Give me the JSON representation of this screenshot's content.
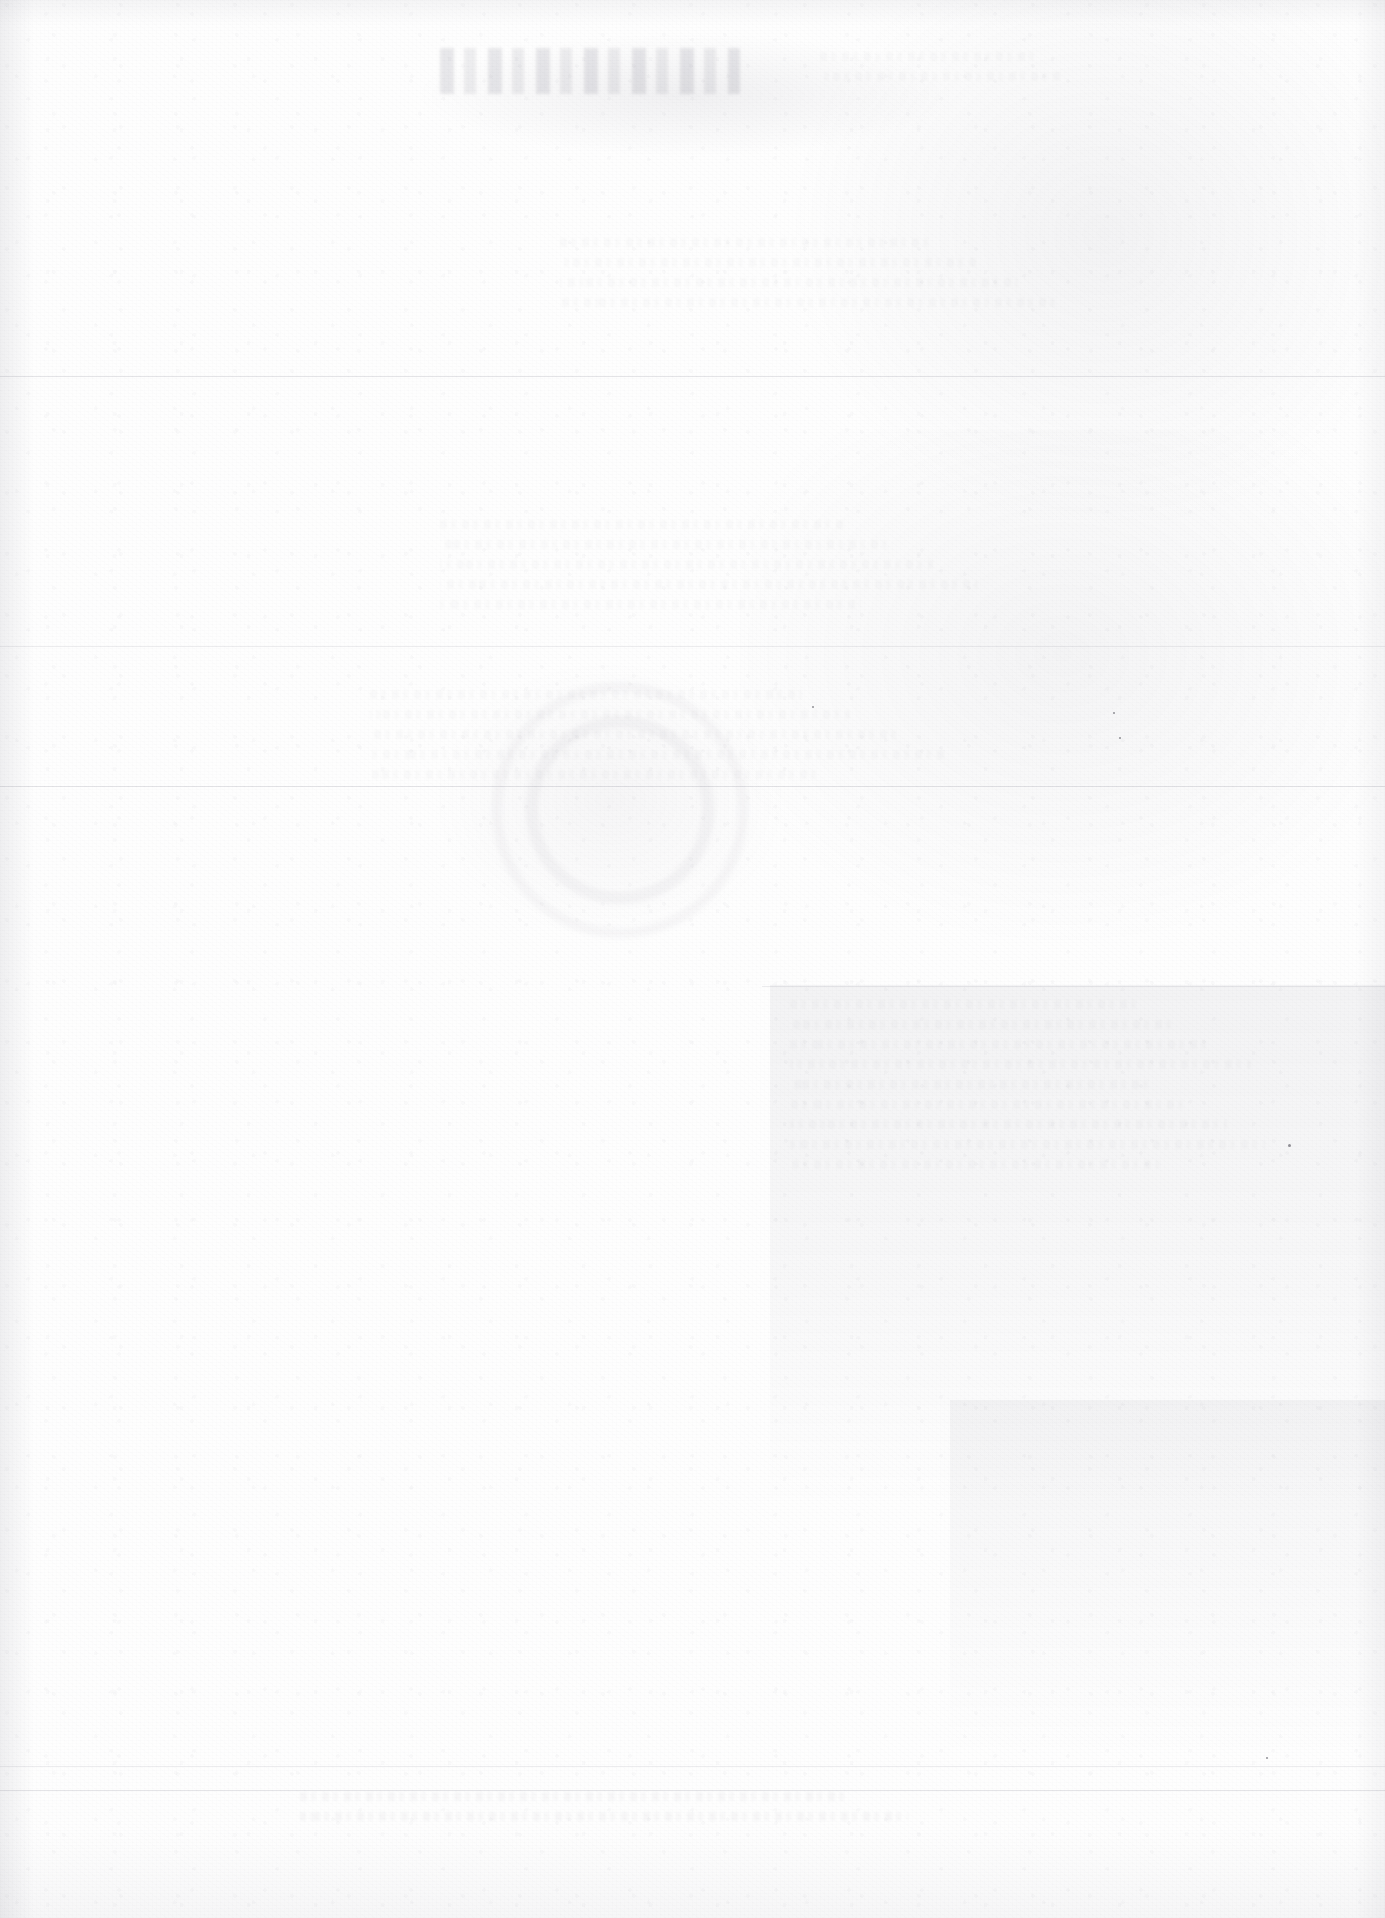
{
  "document": {
    "kind": "scanned-page",
    "condition": "heavily-bleached",
    "legible_text": "",
    "page_width": 1385,
    "page_height": 1918,
    "background_color": "#fefefe",
    "ink_color": "#78768a",
    "note": "No legible characters survive on this scan; only faint ghost impressions, horizontal rules and paper grain are visible."
  },
  "regions": {
    "title_band_label": "",
    "upper_body_label": "",
    "mid_body_label": "",
    "lower_body_label": "",
    "footer_band_label": ""
  },
  "rules": [
    {
      "name": "rule-upper",
      "x": 0,
      "y": 376,
      "width": 1385,
      "weight": "soft"
    },
    {
      "name": "rule-mid-upper",
      "x": 0,
      "y": 646,
      "width": 1385,
      "weight": "softer"
    },
    {
      "name": "rule-mid",
      "x": 0,
      "y": 786,
      "width": 1385,
      "weight": "soft"
    },
    {
      "name": "rule-band-top",
      "x": 762,
      "y": 986,
      "width": 623,
      "weight": "softer"
    },
    {
      "name": "rule-footer-upper",
      "x": 0,
      "y": 1766,
      "width": 1385,
      "weight": "softer"
    },
    {
      "name": "rule-footer",
      "x": 0,
      "y": 1790,
      "width": 1385,
      "weight": "soft"
    }
  ],
  "ghost_text_blocks": [
    {
      "name": "ghost-title",
      "x": 440,
      "y": 48,
      "width": 300,
      "intensity": "faint"
    },
    {
      "name": "ghost-header-right",
      "x": 820,
      "y": 52,
      "width": 300,
      "lines": 2,
      "intensity": "ufaint"
    },
    {
      "name": "ghost-para-upper",
      "x": 560,
      "y": 238,
      "width": 520,
      "lines": 4,
      "intensity": "ufaint"
    },
    {
      "name": "ghost-para-mid",
      "x": 440,
      "y": 520,
      "width": 560,
      "lines": 5,
      "intensity": "ufaint"
    },
    {
      "name": "ghost-para-lower",
      "x": 370,
      "y": 690,
      "width": 600,
      "lines": 5,
      "intensity": "ufaint"
    },
    {
      "name": "ghost-col-right",
      "x": 790,
      "y": 1000,
      "width": 480,
      "lines": 9,
      "intensity": "ufaint"
    },
    {
      "name": "ghost-footer",
      "x": 300,
      "y": 1792,
      "width": 760,
      "lines": 2,
      "intensity": "vfaint"
    }
  ],
  "seal": {
    "name": "seal-ghost",
    "x": 470,
    "y": 660,
    "diameter": 300,
    "intensity": "faint"
  },
  "specks": [
    {
      "x": 1288,
      "y": 1144,
      "size": 3
    },
    {
      "x": 1119,
      "y": 737,
      "size": 2
    },
    {
      "x": 1113,
      "y": 712,
      "size": 2
    },
    {
      "x": 1266,
      "y": 1757,
      "size": 2
    },
    {
      "x": 812,
      "y": 706,
      "size": 2
    }
  ]
}
